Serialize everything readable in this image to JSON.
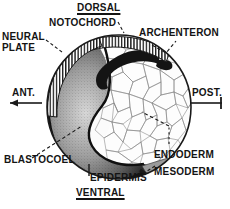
{
  "figure": {
    "kind": "biology-diagram",
    "width": 230,
    "height": 209,
    "background_color": "#ffffff",
    "ink_color": "#141414"
  },
  "axis_labels": {
    "dorsal": "DORSAL",
    "ventral": "VENTRAL",
    "anterior": "ANT.",
    "posterior": "POST."
  },
  "structure_labels": {
    "notochord": "NOTOCHORD",
    "archenteron": "ARCHENTERON",
    "neural_plate": "NEURAL\nPLATE",
    "neural_plate_line1": "NEURAL",
    "neural_plate_line2": "PLATE",
    "blastocoel": "BLASTOCOEL",
    "epidermis": "EPIDERMIS",
    "endoderm": "ENDODERM",
    "mesoderm": "MESODERM"
  },
  "embryo": {
    "center_x": 119,
    "center_y": 107,
    "radius": 72,
    "outline_color": "#1a1a1a",
    "yolk_mass_fill": "#f4f4f4",
    "blastocoel_fill": "#2a2a2a",
    "mesoderm_fill": "#8f8f8f"
  },
  "leader_lines": [
    {
      "from": "notochord",
      "style": "dashed"
    },
    {
      "from": "archenteron",
      "style": "dashed"
    },
    {
      "from": "neural_plate",
      "style": "dashed"
    },
    {
      "from": "blastocoel",
      "style": "dashed"
    },
    {
      "from": "epidermis",
      "style": "solid-tick"
    },
    {
      "from": "endoderm",
      "style": "dashed"
    },
    {
      "from": "mesoderm",
      "style": "dashed"
    }
  ]
}
